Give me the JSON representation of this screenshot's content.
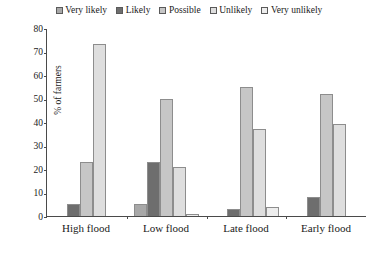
{
  "chart_data": {
    "type": "bar",
    "title": "",
    "xlabel": "",
    "ylabel": "% of farmers",
    "ylim": [
      0,
      80
    ],
    "yticks": [
      0,
      10,
      20,
      30,
      40,
      50,
      60,
      70,
      80
    ],
    "grid": false,
    "legend_position": "top-center",
    "categories": [
      "High flood",
      "Low flood",
      "Late flood",
      "Early flood"
    ],
    "series": [
      {
        "name": "Very likely",
        "color": "#a8a8a8",
        "values": [
          0,
          5,
          0,
          0
        ]
      },
      {
        "name": "Likely",
        "color": "#6e6e6e",
        "values": [
          5,
          23,
          3,
          8
        ]
      },
      {
        "name": "Possible",
        "color": "#c6c6c6",
        "values": [
          23,
          50,
          55,
          52
        ]
      },
      {
        "name": "Unlikely",
        "color": "#dedede",
        "values": [
          73,
          21,
          37,
          39
        ]
      },
      {
        "name": "Very unlikely",
        "color": "#ededed",
        "values": [
          0,
          1,
          4,
          0
        ]
      }
    ]
  }
}
